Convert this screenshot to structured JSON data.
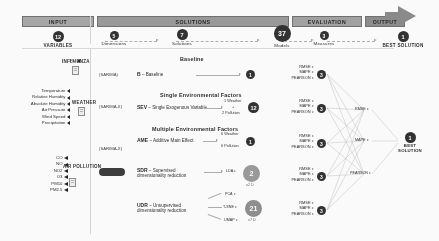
{
  "pipeline": {
    "stages": [
      {
        "id": "input",
        "band_label": "INPUT",
        "count": "12",
        "caption": "VARIABLES",
        "caption_strong": true,
        "bubble": "md"
      },
      {
        "id": "solutions",
        "band_label": "SOLUTIONS",
        "count": "5",
        "caption": "Dimensions",
        "bubble": "sm"
      },
      {
        "id": "solutions_count",
        "count": "7",
        "caption": "Solutions",
        "bubble": "md"
      },
      {
        "id": "models",
        "count": "37",
        "caption": "Models",
        "bubble": "lg"
      },
      {
        "id": "evaluation",
        "band_label": "EVALUATION",
        "count": "3",
        "caption": "Measures",
        "bubble": "sm"
      },
      {
        "id": "output",
        "band_label": "OUTPUT",
        "count": "1",
        "caption": "BEST SOLUTION",
        "caption_strong": true,
        "bubble": "md"
      }
    ]
  },
  "variables": {
    "groups": [
      {
        "tag": "INFLUENZA",
        "items": [
          "Flu"
        ]
      },
      {
        "tag": "WEATHER",
        "items": [
          "Temperature",
          "Relative Humidity",
          "Absolute Humidity",
          "Air Pressure",
          "Wind Speed",
          "Precipitation"
        ]
      },
      {
        "tag": "AIR POLLUTION",
        "items": [
          "CO",
          "NO",
          "NO2",
          "O3",
          "PM10",
          "PM2.5"
        ]
      }
    ]
  },
  "solutions": {
    "sections": [
      {
        "title": "Baseline"
      },
      {
        "title": "Single Environmental Factors"
      },
      {
        "title": "Multiple Environmental Factors"
      }
    ],
    "rows": [
      {
        "id": "baseline",
        "abbr": "B",
        "name": "Baseline",
        "model_note": "(SARIMA)",
        "branch_labels": [],
        "counts": [],
        "count_bubble": "1"
      },
      {
        "id": "sev",
        "abbr": "SEV",
        "name": "Single Exogenous Variable",
        "model_note": "(SARIMA-X)",
        "counts": [
          "1 Weather",
          "+",
          "2 Pollution"
        ],
        "count_bubble": "12"
      },
      {
        "id": "ame",
        "abbr": "AME",
        "name": "Additive Main Effect",
        "model_note": "(SARIMA-X)",
        "counts": [
          "6 Weather",
          "6 Pollution"
        ],
        "count_bubble": "1"
      },
      {
        "id": "sdr",
        "abbr": "SDR",
        "name": "Supervised dimensionality reduction",
        "branch_labels": [
          "LDA"
        ],
        "count_bubble": "2",
        "count_sub": "x2 D"
      },
      {
        "id": "udr",
        "abbr": "UDR",
        "name": "Unsupervised dimensionality reduction",
        "branch_labels": [
          "PCA",
          "T-SNE",
          "UMAP"
        ],
        "count_bubble": "21",
        "count_sub": "x7 D"
      }
    ]
  },
  "evaluation": {
    "metric_names": [
      "RMSE",
      "MAPE",
      "PEARSON"
    ],
    "metric_groups": 5,
    "final_metrics": [
      "RMSE",
      "MAPE",
      "PEARSON"
    ]
  },
  "output": {
    "bubble": "1",
    "label_line1": "BEST",
    "label_line2": "SOLUTION"
  },
  "colors": {
    "band": "#9d9d9d",
    "bubble": "#2f2f2f",
    "text": "#2b2b2b",
    "rule": "#dcdcdc"
  }
}
